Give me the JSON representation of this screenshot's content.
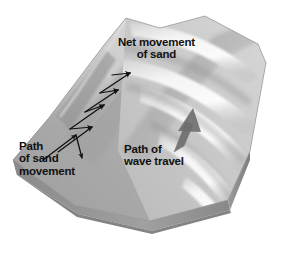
{
  "figure": {
    "title": "Beach drift and longshore transport block diagram",
    "type": "3d-block-diagram",
    "style": "grayscale halftone illustration",
    "background_color": "#ffffff"
  },
  "labels": {
    "net_movement": {
      "name": "net-movement-of-sand-label",
      "line1": "Net movement",
      "line2": "of sand",
      "color": "#111111"
    },
    "path_of_sand": {
      "name": "path-of-sand-movement-label",
      "line1": "Path",
      "line2": "of sand",
      "line3": "movement",
      "color": "#111111"
    },
    "path_of_wave": {
      "name": "path-of-wave-travel-label",
      "line1": "Path of",
      "line2": "wave travel",
      "color": "#111111"
    }
  },
  "annotations": {
    "zigzag_arrow": {
      "name": "zigzag-sand-path-arrow",
      "description": "Black sawtooth zigzag with arrowheads showing swash up the beach and backwash down, progressing along the shore",
      "color": "#101010",
      "segment_count": 8
    },
    "wave_travel_arrow": {
      "name": "wave-travel-direction-arrow",
      "description": "Thick gray arrow in the water pointing toward the shore",
      "color": "#6f6f6f"
    }
  },
  "terrain": {
    "beach": {
      "name": "beach-surface",
      "color": "#a9a9a9"
    },
    "dune_ridge": {
      "name": "dune-ridge",
      "color": "#b8b8b8"
    },
    "water": {
      "name": "water-surface",
      "color": "#c9c9c9"
    },
    "wave_crests": {
      "name": "wave-crest-band",
      "color": "#f2f2f2",
      "count": 5,
      "description": "Curved white wave crests approaching the shore at an oblique angle"
    },
    "left_cutaway_face": {
      "name": "left-cutaway-face",
      "color": "#8e8e8e",
      "description": "Vertically striated sediment cross-section"
    },
    "front_cutaway_face": {
      "name": "front-cutaway-face",
      "color": "#9b9b9b"
    },
    "right_cutaway_face": {
      "name": "right-cutaway-face",
      "color": "#8a8a8a"
    }
  }
}
